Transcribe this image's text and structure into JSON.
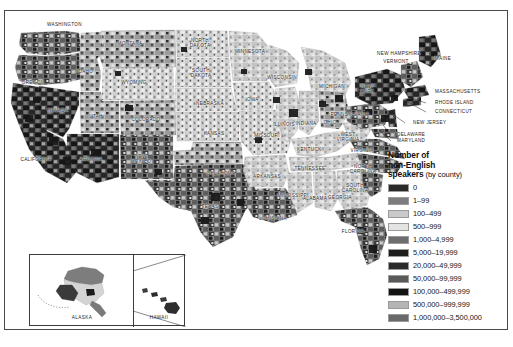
{
  "figure": {
    "kind": "choropleth-map",
    "region": "United States",
    "caption": ""
  },
  "legend": {
    "title_line1": "Number of",
    "title_line2": "non-English",
    "title_line3_bold": "speakers",
    "title_line3_rest": " (by county)",
    "entries": [
      {
        "label": "0",
        "color": "#2a2a2a"
      },
      {
        "label": "1–99",
        "color": "#7d7d7d"
      },
      {
        "label": "100–499",
        "color": "#c9c9c9"
      },
      {
        "label": "500–999",
        "color": "#e4e4e4"
      },
      {
        "label": "1,000–4,999",
        "color": "#6e6e6e"
      },
      {
        "label": "5,000–19,999",
        "color": "#1d1d1d"
      },
      {
        "label": "20,000–49,999",
        "color": "#2b2b2b"
      },
      {
        "label": "50,000–99,999",
        "color": "#5a5a5a"
      },
      {
        "label": "100,000–499,999",
        "color": "#141414"
      },
      {
        "label": "500,000–999,999",
        "color": "#b5b5b5"
      },
      {
        "label": "1,000,000–3,500,000",
        "color": "#6a6a6a"
      }
    ]
  },
  "inset": {
    "alaska_label": "ALASKA",
    "hawaii_label": "HAWAII"
  },
  "state_labels": [
    {
      "name": "WASHINGTON",
      "text": "WASHINGTON",
      "x": 42,
      "y": 14,
      "align": "left"
    },
    {
      "name": "MONTANA",
      "text": "MONTANA",
      "x": 125,
      "y": 33
    },
    {
      "name": "OREGON",
      "text": "OREGON",
      "x": 28,
      "y": 72
    },
    {
      "name": "IDAHO",
      "text": "IDAHO",
      "x": 80,
      "y": 61
    },
    {
      "name": "WYOMING",
      "text": "WYOMING",
      "x": 129,
      "y": 72
    },
    {
      "name": "NEVADA",
      "text": "NEVADA",
      "x": 53,
      "y": 100
    },
    {
      "name": "UTAH",
      "text": "UTAH",
      "x": 91,
      "y": 106
    },
    {
      "name": "COLORADO",
      "text": "COLORADO",
      "x": 141,
      "y": 109
    },
    {
      "name": "CALIFORNIA",
      "text": "CALIFORNIA",
      "x": 31,
      "y": 149
    },
    {
      "name": "ARIZONA",
      "text": "ARIZONA",
      "x": 86,
      "y": 149
    },
    {
      "name": "NEW-MEXICO",
      "text": "NEW\nMEXICO",
      "x": 136,
      "y": 148
    },
    {
      "name": "NORTH-DAKOTA",
      "text": "NORTH\nDAKOTA",
      "x": 195,
      "y": 32
    },
    {
      "name": "SOUTH-DAKOTA",
      "text": "SOUTH\nDAKOTA",
      "x": 196,
      "y": 62
    },
    {
      "name": "NEBRASKA",
      "text": "NEBRASKA",
      "x": 205,
      "y": 93
    },
    {
      "name": "KANSAS",
      "text": "KANSAS",
      "x": 209,
      "y": 123
    },
    {
      "name": "OKLAHOMA",
      "text": "OKLAHOMA",
      "x": 216,
      "y": 163
    },
    {
      "name": "TEXAS",
      "text": "TEXAS",
      "x": 205,
      "y": 196
    },
    {
      "name": "MINNESOTA",
      "text": "MINNESOTA",
      "x": 245,
      "y": 41
    },
    {
      "name": "IOWA",
      "text": "IOWA",
      "x": 247,
      "y": 89
    },
    {
      "name": "MISSOURI",
      "text": "MISSOURI",
      "x": 262,
      "y": 125
    },
    {
      "name": "ARKANSAS",
      "text": "ARKANSAS",
      "x": 262,
      "y": 166
    },
    {
      "name": "LOUISIANA",
      "text": "LOUISIANA",
      "x": 268,
      "y": 208
    },
    {
      "name": "MISSISSIPPI",
      "text": "MISSISSIPPI",
      "x": 288,
      "y": 185
    },
    {
      "name": "ALABAMA",
      "text": "ALABAMA",
      "x": 310,
      "y": 188
    },
    {
      "name": "GEORGIA",
      "text": "GEORGIA",
      "x": 335,
      "y": 187
    },
    {
      "name": "FLORIDA",
      "text": "FLORIDA",
      "x": 348,
      "y": 221
    },
    {
      "name": "WISCONSIN",
      "text": "WISCONSIN",
      "x": 277,
      "y": 67
    },
    {
      "name": "MICHIGAN",
      "text": "MICHIGAN",
      "x": 327,
      "y": 76
    },
    {
      "name": "ILLINOIS",
      "text": "ILLINOIS",
      "x": 279,
      "y": 114
    },
    {
      "name": "INDIANA",
      "text": "INDIANA",
      "x": 301,
      "y": 113
    },
    {
      "name": "OHIO",
      "text": "OHIO",
      "x": 325,
      "y": 112
    },
    {
      "name": "KENTUCKY",
      "text": "KENTUCKY",
      "x": 306,
      "y": 139
    },
    {
      "name": "TENNESSEE",
      "text": "TENNESSEE",
      "x": 305,
      "y": 158
    },
    {
      "name": "WEST-VIRGINIA",
      "text": "WEST\nVIRGINIA",
      "x": 343,
      "y": 126
    },
    {
      "name": "VIRGINIA",
      "text": "VIRGINIA",
      "x": 357,
      "y": 140
    },
    {
      "name": "NORTH-CAROLINA",
      "text": "NORTH\nCAROLINA",
      "x": 358,
      "y": 158
    },
    {
      "name": "SOUTH-CAROLINA",
      "text": "SOUTH\nCAROLINA",
      "x": 350,
      "y": 177
    },
    {
      "name": "PENNSYLVANIA",
      "text": "PENNSYLVANIA",
      "x": 345,
      "y": 104
    },
    {
      "name": "NEW-YORK",
      "text": "NEW\nYORK",
      "x": 362,
      "y": 78
    },
    {
      "name": "NEW-HAMPSHIRE",
      "text": "NEW HAMPSHIRE",
      "x": 394,
      "y": 43
    },
    {
      "name": "VERMONT",
      "text": "VERMONT",
      "x": 391,
      "y": 51
    },
    {
      "name": "MAINE",
      "text": "MAINE",
      "x": 438,
      "y": 48
    },
    {
      "name": "MASSACHUSETTS",
      "text": "MASSACHUSETTS",
      "x": 430,
      "y": 81,
      "align": "left"
    },
    {
      "name": "RHODE-ISLAND",
      "text": "RHODE ISLAND",
      "x": 430,
      "y": 92,
      "align": "left"
    },
    {
      "name": "CONNECTICUT",
      "text": "CONNECTICUT",
      "x": 430,
      "y": 101,
      "align": "left"
    },
    {
      "name": "NEW-JERSEY",
      "text": "NEW JERSEY",
      "x": 408,
      "y": 112,
      "align": "left"
    },
    {
      "name": "DELAWARE",
      "text": "DELAWARE",
      "x": 392,
      "y": 124,
      "align": "left"
    },
    {
      "name": "MARYLAND",
      "text": "MARYLAND",
      "x": 392,
      "y": 130,
      "align": "left"
    }
  ],
  "leader_lines": [
    {
      "name": "leader-massachusetts",
      "x1": 421,
      "y1": 81,
      "x2": 405,
      "y2": 81
    },
    {
      "name": "leader-rhode-island",
      "x1": 421,
      "y1": 92,
      "x2": 403,
      "y2": 86
    },
    {
      "name": "leader-connecticut",
      "x1": 421,
      "y1": 101,
      "x2": 399,
      "y2": 89
    },
    {
      "name": "leader-new-jersey",
      "x1": 400,
      "y1": 112,
      "x2": 386,
      "y2": 102
    },
    {
      "name": "leader-delaware",
      "x1": 386,
      "y1": 124,
      "x2": 378,
      "y2": 114
    },
    {
      "name": "leader-maryland",
      "x1": 386,
      "y1": 130,
      "x2": 374,
      "y2": 119
    }
  ],
  "chart_data": {
    "type": "heatmap",
    "title": "Number of non-English speakers (by county)",
    "unit": "people",
    "geography": "US counties",
    "bins": [
      {
        "label": "0",
        "min": 0,
        "max": 0,
        "color": "#2a2a2a"
      },
      {
        "label": "1–99",
        "min": 1,
        "max": 99,
        "color": "#7d7d7d"
      },
      {
        "label": "100–499",
        "min": 100,
        "max": 499,
        "color": "#c9c9c9"
      },
      {
        "label": "500–999",
        "min": 500,
        "max": 999,
        "color": "#e4e4e4"
      },
      {
        "label": "1,000–4,999",
        "min": 1000,
        "max": 4999,
        "color": "#6e6e6e"
      },
      {
        "label": "5,000–19,999",
        "min": 5000,
        "max": 19999,
        "color": "#1d1d1d"
      },
      {
        "label": "20,000–49,999",
        "min": 20000,
        "max": 49999,
        "color": "#2b2b2b"
      },
      {
        "label": "50,000–99,999",
        "min": 50000,
        "max": 99999,
        "color": "#5a5a5a"
      },
      {
        "label": "100,000–499,999",
        "min": 100000,
        "max": 499999,
        "color": "#141414"
      },
      {
        "label": "500,000–999,999",
        "min": 500000,
        "max": 999999,
        "color": "#b5b5b5"
      },
      {
        "label": "1,000,000–3,500,000",
        "min": 1000000,
        "max": 3500000,
        "color": "#6a6a6a"
      }
    ],
    "legend_position": "right",
    "grid": false
  }
}
